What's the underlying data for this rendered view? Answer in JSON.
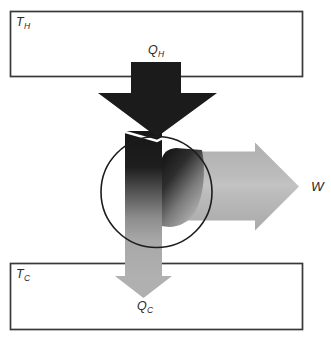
{
  "figure": {
    "labels": {
      "hot_reservoir": {
        "main": "T",
        "sub": "H"
      },
      "cold_reservoir": {
        "main": "T",
        "sub": "C"
      },
      "heat_in": {
        "main": "Q",
        "sub": "H"
      },
      "heat_out": {
        "main": "Q",
        "sub": "C"
      },
      "work": "W"
    },
    "colors": {
      "heat_in_arrow": "#1b1b1b",
      "work_arrow": "#b5b5b5",
      "heat_out_arrow": "#b0b0b0",
      "reservoir_fill": "#ffffff",
      "outline": "#383838",
      "engine_circle": "#1c1c1c",
      "background": "#ffffff",
      "tip_highlight": "#ffffff"
    }
  }
}
